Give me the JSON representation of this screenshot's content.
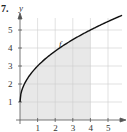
{
  "problem_number": "7.",
  "chart_data": {
    "type": "area",
    "title": "",
    "xlabel": "x",
    "ylabel": "y",
    "xlim": [
      0,
      5.8
    ],
    "ylim": [
      0,
      5.6
    ],
    "xticks": [
      1,
      2,
      3,
      4,
      5
    ],
    "yticks": [
      1,
      2,
      3,
      4,
      5
    ],
    "grid": true,
    "curve_label": "f",
    "function": "f(x) = 1 + 2*sqrt(x)",
    "x": [
      0,
      0.25,
      0.5,
      1,
      1.5,
      2,
      2.5,
      3,
      3.5,
      4,
      4.5,
      5,
      5.5,
      5.8
    ],
    "y": [
      1,
      2,
      2.41,
      3,
      3.45,
      3.83,
      4.16,
      4.46,
      4.74,
      5,
      5.24,
      5.47,
      5.69,
      5.82
    ],
    "shaded_region": {
      "x_from": 0,
      "x_to": 4,
      "description": "area under f between x=0 and x=4"
    }
  }
}
